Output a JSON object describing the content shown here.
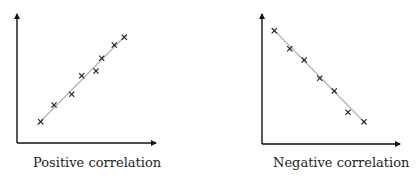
{
  "chart_data": [
    {
      "type": "scatter",
      "title": "Positive correlation",
      "xlabel": "",
      "ylabel": "",
      "grid": false,
      "trendline": true,
      "marker": "x",
      "points_px": [
        [
          40.7,
          121.7
        ],
        [
          54,
          105
        ],
        [
          71.7,
          94.3
        ],
        [
          81.7,
          75.7
        ],
        [
          96,
          71
        ],
        [
          101.7,
          58.3
        ],
        [
          114.3,
          45
        ],
        [
          124.3,
          37.3
        ]
      ],
      "x": [
        1.2,
        2.0,
        3.1,
        3.7,
        4.6,
        4.9,
        5.7,
        6.3
      ],
      "y": [
        1.2,
        2.2,
        2.8,
        3.9,
        4.2,
        5.0,
        5.8,
        6.3
      ],
      "trend_px": [
        [
          37,
          125
        ],
        [
          127,
          34
        ]
      ]
    },
    {
      "type": "scatter",
      "title": "Negative correlation",
      "xlabel": "",
      "ylabel": "",
      "grid": false,
      "trendline": true,
      "marker": "x",
      "points_px": [
        [
          274.3,
          30.7
        ],
        [
          289.7,
          48.7
        ],
        [
          304.3,
          60
        ],
        [
          319.7,
          78.3
        ],
        [
          334.3,
          91
        ],
        [
          348,
          112.3
        ],
        [
          364,
          121.7
        ]
      ],
      "x": [
        0.8,
        1.7,
        2.6,
        3.6,
        4.5,
        5.4,
        6.4
      ],
      "y": [
        6.8,
        5.7,
        5.0,
        3.9,
        3.1,
        1.8,
        1.2
      ],
      "trend_px": [
        [
          272,
          28
        ],
        [
          366,
          124
        ]
      ]
    }
  ],
  "captions": {
    "left": "Positive correlation",
    "right": "Negative correlation"
  },
  "colors": {
    "axis": "#111111",
    "trend": "#b5b5b5",
    "marker": "#222222"
  }
}
